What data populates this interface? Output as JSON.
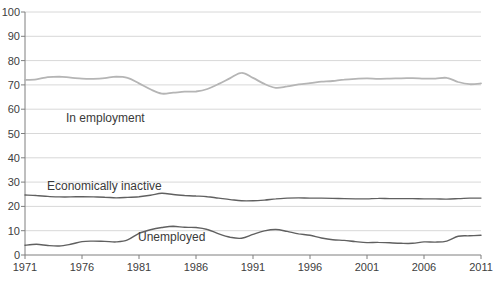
{
  "chart_data": {
    "type": "line",
    "title": "",
    "xlabel": "",
    "ylabel": "",
    "xlim": [
      1971,
      2011
    ],
    "ylim": [
      0,
      100
    ],
    "grid": "horizontal",
    "legend": "inline-labels",
    "y_ticks": [
      0,
      10,
      20,
      30,
      40,
      50,
      60,
      70,
      80,
      90,
      100
    ],
    "x_tick_years": [
      1971,
      1976,
      1981,
      1986,
      1991,
      1996,
      2001,
      2006,
      2011
    ],
    "years": [
      1971,
      1972,
      1973,
      1974,
      1975,
      1976,
      1977,
      1978,
      1979,
      1980,
      1981,
      1982,
      1983,
      1984,
      1985,
      1986,
      1987,
      1988,
      1989,
      1990,
      1991,
      1992,
      1993,
      1994,
      1995,
      1996,
      1997,
      1998,
      1999,
      2000,
      2001,
      2002,
      2003,
      2004,
      2005,
      2006,
      2007,
      2008,
      2009,
      2010,
      2011
    ],
    "series": [
      {
        "id": "in-employment",
        "name": "In employment",
        "color": "#b5b5b5",
        "values": [
          72.0,
          72.3,
          73.2,
          73.4,
          73.0,
          72.6,
          72.5,
          72.8,
          73.4,
          72.9,
          70.6,
          68.2,
          66.4,
          66.8,
          67.2,
          67.3,
          68.3,
          70.4,
          72.8,
          75.0,
          72.9,
          70.4,
          68.8,
          69.4,
          70.2,
          70.7,
          71.3,
          71.6,
          72.2,
          72.5,
          72.7,
          72.5,
          72.6,
          72.7,
          72.8,
          72.6,
          72.6,
          72.9,
          71.2,
          70.3,
          70.6
        ]
      },
      {
        "id": "economically-inactive",
        "name": "Economically inactive",
        "color": "#606060",
        "values": [
          24.7,
          24.5,
          24.1,
          23.9,
          23.9,
          24.0,
          23.9,
          23.8,
          23.5,
          23.7,
          24.0,
          24.6,
          25.4,
          24.9,
          24.5,
          24.3,
          24.0,
          23.4,
          22.8,
          22.3,
          22.3,
          22.6,
          23.1,
          23.4,
          23.5,
          23.4,
          23.4,
          23.3,
          23.2,
          23.1,
          23.1,
          23.3,
          23.2,
          23.2,
          23.2,
          23.1,
          23.1,
          23.0,
          23.2,
          23.4,
          23.4
        ]
      },
      {
        "id": "unemployed",
        "name": "Unemployed",
        "color": "#606060",
        "values": [
          4.0,
          4.4,
          3.9,
          3.7,
          4.4,
          5.5,
          5.7,
          5.6,
          5.4,
          6.2,
          8.9,
          10.4,
          11.3,
          11.8,
          11.4,
          11.3,
          10.5,
          8.7,
          7.3,
          6.9,
          8.5,
          9.9,
          10.5,
          9.7,
          8.7,
          8.1,
          7.0,
          6.3,
          6.0,
          5.5,
          5.1,
          5.2,
          5.0,
          4.8,
          4.8,
          5.4,
          5.3,
          5.7,
          7.7,
          7.9,
          8.1
        ]
      }
    ],
    "colors": {
      "background": "#ffffff",
      "grid": "#d8d8d8",
      "axis": "#7f7f7f",
      "tick_text": "#404040",
      "label_text": "#3a3a3a"
    }
  }
}
